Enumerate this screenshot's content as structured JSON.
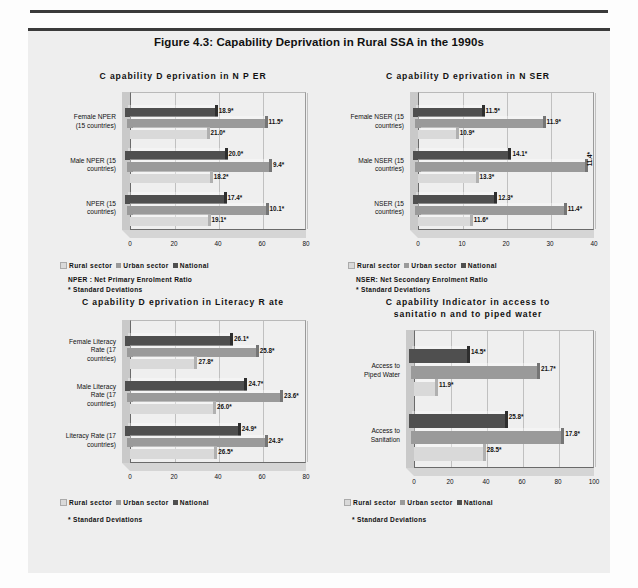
{
  "figure": {
    "title": "Figure 4.3: Capability Deprivation in Rural SSA in the 1990s"
  },
  "legend": {
    "rural": "Rural sector",
    "urban": "Urban sector",
    "national": "National"
  },
  "charts": [
    {
      "id": "nper",
      "title": "C apability D eprivation in N P ER",
      "note": "NPER : Net Primary Enrolment  Ratio\n*    Standard Deviations",
      "categories": [
        "Female NPER\n(15 countries)",
        "Male NPER (15\ncountries)",
        "NPER (15\ncountries)"
      ],
      "xticks": [
        "0",
        "20",
        "40",
        "60",
        "80"
      ],
      "xmax": 80,
      "rows": [
        {
          "national": {
            "value": 41.0,
            "label": "18.9*"
          },
          "urban": {
            "value": 62.5,
            "label": "11.5*"
          },
          "rural": {
            "value": 35.0,
            "label": "21.0*"
          }
        },
        {
          "national": {
            "value": 45.5,
            "label": "20.0*"
          },
          "urban": {
            "value": 64.5,
            "label": "9.4*"
          },
          "rural": {
            "value": 36.5,
            "label": "18.2*"
          }
        },
        {
          "national": {
            "value": 45.0,
            "label": "17.4*"
          },
          "urban": {
            "value": 63.0,
            "label": "10.1*"
          },
          "rural": {
            "value": 35.5,
            "label": "19.1*"
          }
        }
      ]
    },
    {
      "id": "nser",
      "title": "C apability D eprivation in N SER",
      "note": "NSER: Net Secondary Enrolment Ratio\n*    Standard Deviations",
      "categories": [
        "Female NSER (15\ncountries)",
        "Male NSER (15\ncountries)",
        "NSER (15\ncountries)"
      ],
      "xticks": [
        "0",
        "10",
        "20",
        "30",
        "40"
      ],
      "xmax": 40,
      "rows": [
        {
          "national": {
            "value": 15.7,
            "label": "11.5*"
          },
          "urban": {
            "value": 29.0,
            "label": "11.9*"
          },
          "rural": {
            "value": 8.7,
            "label": "10.9*"
          }
        },
        {
          "national": {
            "value": 21.8,
            "label": "14.1*"
          },
          "urban": {
            "value": 38.6,
            "label": "11.4*",
            "vertical": true
          },
          "rural": {
            "value": 13.2,
            "label": "13.3*"
          }
        },
        {
          "national": {
            "value": 18.6,
            "label": "12.3*"
          },
          "urban": {
            "value": 33.8,
            "label": "11.4*"
          },
          "rural": {
            "value": 11.9,
            "label": "11.6*"
          }
        }
      ]
    },
    {
      "id": "literacy",
      "title": "C apability D eprivation in Literacy R ate",
      "note": "*    Standard Deviations",
      "categories": [
        "Female Literacy\nRate (17\ncountries)",
        "Male Literacy\nRate (17\ncountries)",
        "Literacy Rate (17\ncountries)"
      ],
      "xticks": [
        "0",
        "20",
        "40",
        "60",
        "80"
      ],
      "xmax": 80,
      "rows": [
        {
          "national": {
            "value": 48.0,
            "label": "26.1*"
          },
          "urban": {
            "value": 58.5,
            "label": "25.8*"
          },
          "rural": {
            "value": 29.5,
            "label": "27.8*"
          }
        },
        {
          "national": {
            "value": 54.5,
            "label": "24.7*"
          },
          "urban": {
            "value": 69.5,
            "label": "23.6*"
          },
          "rural": {
            "value": 38.0,
            "label": "26.0*"
          }
        },
        {
          "national": {
            "value": 51.5,
            "label": "24.9*"
          },
          "urban": {
            "value": 62.5,
            "label": "24.3*"
          },
          "rural": {
            "value": 38.5,
            "label": "26.5*"
          }
        }
      ]
    },
    {
      "id": "sanitation",
      "title": "C apability Indicator in access to\nsanitatio n and to  piped water",
      "note": "*    Standard Deviations",
      "categories": [
        "Access to\nPiped Water",
        "Access to\nSanitation"
      ],
      "xticks": [
        "0",
        "20",
        "40",
        "60",
        "80",
        "100"
      ],
      "xmax": 100,
      "rows": [
        {
          "national": {
            "value": 32.5,
            "label": "14.5*"
          },
          "urban": {
            "value": 70.0,
            "label": "21.7*"
          },
          "rural": {
            "value": 12.0,
            "label": "11.9*"
          }
        },
        {
          "national": {
            "value": 53.5,
            "label": "25.8*"
          },
          "urban": {
            "value": 83.5,
            "label": "17.8*"
          },
          "rural": {
            "value": 38.5,
            "label": "28.5*"
          }
        }
      ]
    }
  ],
  "colors": {
    "rural": "#d9d9d9",
    "urban": "#9a9a9a",
    "national": "#4f4f4f"
  },
  "chart_data": {
    "type": "bar",
    "orientation": "horizontal",
    "title": "Figure 4.3: Capability Deprivation in Rural SSA in the 1990s",
    "legend_position": "below-plot",
    "grid": true,
    "panels": [
      {
        "title": "Capability Deprivation in NPER",
        "xlabel": "",
        "ylabel": "",
        "xlim": [
          0,
          80
        ],
        "xticks": [
          0,
          20,
          40,
          60,
          80
        ],
        "categories": [
          "Female NPER (15 countries)",
          "Male NPER (15 countries)",
          "NPER (15 countries)"
        ],
        "series": [
          {
            "name": "Rural sector",
            "values": [
              35.0,
              36.5,
              35.5
            ],
            "labels": [
              "21.0*",
              "18.2*",
              "19.1*"
            ]
          },
          {
            "name": "Urban sector",
            "values": [
              62.5,
              64.5,
              63.0
            ],
            "labels": [
              "11.5*",
              "9.4*",
              "10.1*"
            ]
          },
          {
            "name": "National",
            "values": [
              41.0,
              45.5,
              45.0
            ],
            "labels": [
              "18.9*",
              "20.0*",
              "17.4*"
            ]
          }
        ],
        "annotations": [
          "NPER : Net Primary Enrolment Ratio",
          "* Standard Deviations"
        ]
      },
      {
        "title": "Capability Deprivation in NSER",
        "xlabel": "",
        "ylabel": "",
        "xlim": [
          0,
          40
        ],
        "xticks": [
          0,
          10,
          20,
          30,
          40
        ],
        "categories": [
          "Female NSER (15 countries)",
          "Male NSER (15 countries)",
          "NSER (15 countries)"
        ],
        "series": [
          {
            "name": "Rural sector",
            "values": [
              8.7,
              13.2,
              11.9
            ],
            "labels": [
              "10.9*",
              "13.3*",
              "11.6*"
            ]
          },
          {
            "name": "Urban sector",
            "values": [
              29.0,
              38.6,
              33.8
            ],
            "labels": [
              "11.9*",
              "11.4*",
              "11.4*"
            ]
          },
          {
            "name": "National",
            "values": [
              15.7,
              21.8,
              18.6
            ],
            "labels": [
              "11.5*",
              "14.1*",
              "12.3*"
            ]
          }
        ],
        "annotations": [
          "NSER: Net Secondary Enrolment Ratio",
          "* Standard Deviations"
        ]
      },
      {
        "title": "Capability Deprivation in Literacy Rate",
        "xlabel": "",
        "ylabel": "",
        "xlim": [
          0,
          80
        ],
        "xticks": [
          0,
          20,
          40,
          60,
          80
        ],
        "categories": [
          "Female Literacy Rate (17 countries)",
          "Male Literacy Rate (17 countries)",
          "Literacy Rate (17 countries)"
        ],
        "series": [
          {
            "name": "Rural sector",
            "values": [
              29.5,
              38.0,
              38.5
            ],
            "labels": [
              "27.8*",
              "26.0*",
              "26.5*"
            ]
          },
          {
            "name": "Urban sector",
            "values": [
              58.5,
              69.5,
              62.5
            ],
            "labels": [
              "25.8*",
              "23.6*",
              "24.3*"
            ]
          },
          {
            "name": "National",
            "values": [
              48.0,
              54.5,
              51.5
            ],
            "labels": [
              "26.1*",
              "24.7*",
              "24.9*"
            ]
          }
        ],
        "annotations": [
          "* Standard Deviations"
        ]
      },
      {
        "title": "Capability Indicator in access to sanitation and to piped water",
        "xlabel": "",
        "ylabel": "",
        "xlim": [
          0,
          100
        ],
        "xticks": [
          0,
          20,
          40,
          60,
          80,
          100
        ],
        "categories": [
          "Access to Piped Water",
          "Access to Sanitation"
        ],
        "series": [
          {
            "name": "Rural sector",
            "values": [
              12.0,
              38.5
            ],
            "labels": [
              "11.9*",
              "28.5*"
            ]
          },
          {
            "name": "Urban sector",
            "values": [
              70.0,
              83.5
            ],
            "labels": [
              "21.7*",
              "17.8*"
            ]
          },
          {
            "name": "National",
            "values": [
              32.5,
              53.5
            ],
            "labels": [
              "14.5*",
              "25.8*"
            ]
          }
        ],
        "annotations": [
          "* Standard Deviations"
        ]
      }
    ]
  }
}
